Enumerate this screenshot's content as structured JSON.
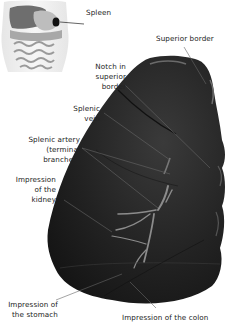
{
  "figure": {
    "subject": "Spleen",
    "inset": {
      "label": "Spleen",
      "description": "Torso with abdominal organs; spleen highlighted"
    },
    "labels": [
      {
        "id": "superior-border",
        "text": "Superior border"
      },
      {
        "id": "notch-superior-border",
        "text": "Notch in\nsuperior\nborder"
      },
      {
        "id": "splenic-vein",
        "text": "Splenic\nvein"
      },
      {
        "id": "splenic-artery",
        "text": "Splenic artery\n(terminal\nbranches)"
      },
      {
        "id": "impression-kidney",
        "text": "Impression\nof the\nkidney"
      },
      {
        "id": "impression-stomach",
        "text": "Impression of\nthe stomach"
      },
      {
        "id": "impression-colon",
        "text": "Impression of the colon"
      }
    ],
    "colors": {
      "organ": "#1f1f1f",
      "organ_highlight": "#5a5a5a",
      "vessel": "#8a8a8a",
      "leader": "#666666",
      "text": "#222222"
    }
  }
}
